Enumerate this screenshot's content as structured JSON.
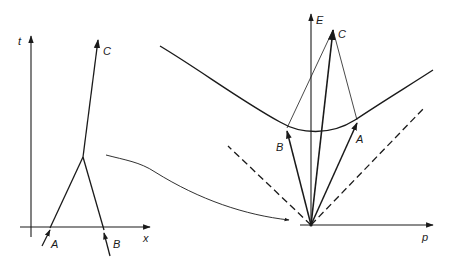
{
  "figure": {
    "ink_color": "#1a1a1a",
    "background": "#ffffff"
  },
  "spacetime_diagram": {
    "vertical_axis_label": "t",
    "horizontal_axis_label": "x",
    "worldlines": [
      {
        "label": "A",
        "role": "incoming"
      },
      {
        "label": "B",
        "role": "incoming"
      },
      {
        "label": "C",
        "role": "outgoing"
      }
    ]
  },
  "momentum_diagram": {
    "vertical_axis_label": "E",
    "horizontal_axis_label": "p",
    "vectors": [
      {
        "label": "A"
      },
      {
        "label": "B"
      },
      {
        "label": "C"
      }
    ],
    "mass_shell": "hyperbola",
    "light_cone": "dashed"
  },
  "connector": {
    "description": "curved arrow from collision vertex to momentum-space origin"
  }
}
